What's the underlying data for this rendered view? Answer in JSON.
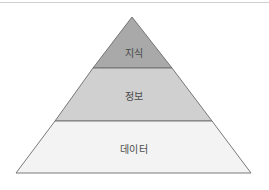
{
  "diagram": {
    "type": "pyramid",
    "layers": [
      {
        "label": "지식",
        "fill": "#a9a9a9",
        "position": "top"
      },
      {
        "label": "정보",
        "fill": "#d0d0d0",
        "position": "middle"
      },
      {
        "label": "데이터",
        "fill": "#f3f3f3",
        "position": "bottom"
      }
    ],
    "stroke_color": "#6b6b6b"
  }
}
